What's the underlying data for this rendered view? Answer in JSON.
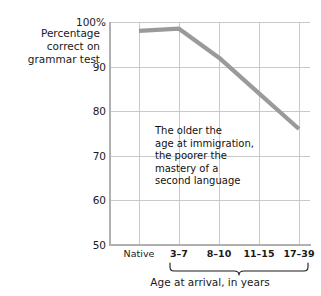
{
  "chart_data": {
    "type": "line",
    "title": "",
    "subtitle": "",
    "categories": [
      "Native",
      "3–7",
      "8–10",
      "11–15",
      "17–39"
    ],
    "values": [
      98,
      98.5,
      92,
      84,
      76
    ],
    "series": [
      {
        "name": "Percentage correct on grammar test",
        "values": [
          98,
          98.5,
          92,
          84,
          76
        ],
        "color": "#9a9a9a"
      }
    ],
    "xlabel": "Age at arrival, in years",
    "ylabel": "Percentage correct on grammar test",
    "ylim": [
      50,
      100
    ],
    "yticks": [
      50,
      60,
      70,
      80,
      90,
      100
    ],
    "ytick_labels": [
      "50",
      "60",
      "70",
      "80",
      "90",
      "100%"
    ],
    "xtick_labels": [
      "Native",
      "3–7",
      "8–10",
      "11–15",
      "17–39"
    ],
    "grid": true,
    "legend": false,
    "legend_position": "none",
    "annotations": [
      {
        "name": "trend-note",
        "lines": [
          "The older the",
          "age at immigration,",
          "the poorer the",
          "mastery of a",
          "second language"
        ]
      }
    ],
    "brace": {
      "caption": "Age at arrival, in years",
      "spans_categories": [
        "3–7",
        "8–10",
        "11–15",
        "17–39"
      ]
    },
    "colors": {
      "line": "#9a9a9a",
      "grid": "#c9c9c9",
      "axis": "#b0b0b0",
      "text": "#1a1a1a",
      "background": "#ffffff"
    }
  },
  "y_axis": {
    "title_lines": [
      "Percentage",
      "correct on",
      "grammar test"
    ],
    "ticks": [
      {
        "label": "100%",
        "value": 100
      },
      {
        "label": "90",
        "value": 90
      },
      {
        "label": "80",
        "value": 80
      },
      {
        "label": "70",
        "value": 70
      },
      {
        "label": "60",
        "value": 60
      },
      {
        "label": "50",
        "value": 50
      }
    ]
  },
  "x_axis": {
    "caption": "Age at arrival, in years",
    "ticks": [
      {
        "label": "Native",
        "bold": false
      },
      {
        "label": "3–7",
        "bold": true
      },
      {
        "label": "8–10",
        "bold": true
      },
      {
        "label": "11–15",
        "bold": true
      },
      {
        "label": "17–39",
        "bold": true
      }
    ]
  },
  "annotation": {
    "line1": "The older the",
    "line2": "age at immigration,",
    "line3": "the poorer the",
    "line4": "mastery of a",
    "line5": "second language"
  }
}
